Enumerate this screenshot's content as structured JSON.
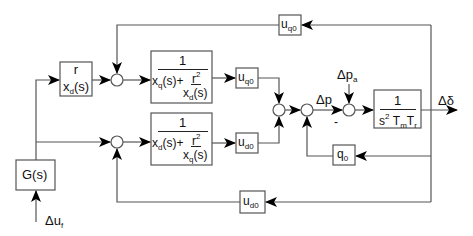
{
  "diagram": {
    "type": "control block diagram",
    "line_color": "#555555",
    "box_color": "#555555",
    "blocks": {
      "r_over_xd": {
        "numerator": "r",
        "denominator_base": "x",
        "denominator_sub": "d",
        "denominator_tail": "(s)"
      },
      "top_main": {
        "numerator": "1",
        "den_term1_base": "x",
        "den_term1_sub": "q",
        "den_term1_tail": "(s)+",
        "inner_num_base": "r",
        "inner_num_sup": "2",
        "inner_den_base": "x",
        "inner_den_sub": "d",
        "inner_den_tail": "(s)"
      },
      "bottom_main": {
        "numerator": "1",
        "den_term1_base": "x",
        "den_term1_sub": "d",
        "den_term1_tail": "(s)+",
        "inner_num_base": "r",
        "inner_num_sup": "2",
        "inner_den_base": "x",
        "inner_den_sub": "q",
        "inner_den_tail": "(s)"
      },
      "uq0_mid": {
        "base": "u",
        "sub": "q0"
      },
      "ud0_mid": {
        "base": "u",
        "sub": "d0"
      },
      "uq0_top": {
        "base": "u",
        "sub": "q0"
      },
      "ud0_bottom": {
        "base": "u",
        "sub": "d0"
      },
      "q0": {
        "base": "q",
        "sub": "0"
      },
      "plant": {
        "numerator": "1",
        "den_base": "s",
        "den_sup": "2",
        "den_T1": "T",
        "den_T1_sub": "m",
        "den_T2": "T",
        "den_T2_sub": "r"
      },
      "G": {
        "label": "G(s)"
      }
    },
    "signals": {
      "delta_p": "Δp",
      "delta_pa_base": "Δp",
      "delta_pa_sub": "a",
      "delta_delta": "Δδ",
      "delta_uf_base": "Δu",
      "delta_uf_sub": "f",
      "minus_sign": "-"
    }
  }
}
